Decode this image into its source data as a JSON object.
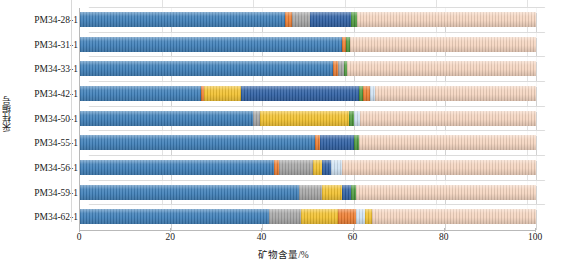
{
  "chart_data": {
    "type": "bar",
    "orientation": "horizontal",
    "stacked": true,
    "title": "",
    "xlabel": "矿物含量/%",
    "ylabel": "采样编号",
    "xlim": [
      0,
      100
    ],
    "xticks": [
      0,
      20,
      40,
      60,
      80,
      100
    ],
    "grid": true,
    "legend": "none",
    "categories": [
      "PM34-28-1",
      "PM34-31-1",
      "PM34-33-1",
      "PM34-42-1",
      "PM34-50-1",
      "PM34-55-1",
      "PM34-56-1",
      "PM34-59-1",
      "PM34-62-1"
    ],
    "series": [
      {
        "name": "矿物1",
        "color": "#3D7EB8",
        "values": [
          45.0,
          57.5,
          55.5,
          26.5,
          38.0,
          51.5,
          42.5,
          48.0,
          41.5
        ]
      },
      {
        "name": "矿物2",
        "color": "#ED7D31",
        "values": [
          1.5,
          0.8,
          1.0,
          0.8,
          0.0,
          1.2,
          1.2,
          0.0,
          0.0
        ]
      },
      {
        "name": "矿物3",
        "color": "#A5A5A5",
        "values": [
          4.0,
          0.0,
          1.5,
          0.0,
          1.5,
          0.0,
          7.5,
          5.0,
          7.0
        ]
      },
      {
        "name": "矿物4",
        "color": "#F2C12E",
        "values": [
          0.0,
          0.0,
          0.0,
          8.0,
          19.5,
          0.0,
          1.8,
          4.5,
          8.0
        ]
      },
      {
        "name": "矿物5",
        "color": "#2E5FA3",
        "values": [
          9.0,
          0.0,
          0.0,
          26.0,
          0.0,
          7.5,
          2.0,
          2.0,
          0.0
        ]
      },
      {
        "name": "矿物6",
        "color": "#4E9A3E",
        "values": [
          1.2,
          1.0,
          0.5,
          0.8,
          1.0,
          1.0,
          0.0,
          1.0,
          0.0
        ]
      },
      {
        "name": "矿物7",
        "color": "#ED7D31",
        "values": [
          0.0,
          0.0,
          0.0,
          1.5,
          0.0,
          0.0,
          0.0,
          0.0,
          4.0
        ]
      },
      {
        "name": "矿物8",
        "color": "#CFE2F3",
        "values": [
          0.0,
          0.0,
          0.0,
          1.0,
          1.5,
          0.0,
          2.5,
          0.0,
          2.0
        ]
      },
      {
        "name": "矿物9",
        "color": "#F2C12E",
        "values": [
          0.0,
          0.0,
          0.0,
          0.0,
          0.0,
          0.0,
          0.0,
          0.0,
          1.5
        ]
      },
      {
        "name": "矿物10",
        "color": "#F5D5C0",
        "values": [
          39.3,
          40.7,
          41.5,
          35.4,
          38.5,
          38.8,
          42.5,
          39.5,
          36.0
        ]
      }
    ]
  }
}
